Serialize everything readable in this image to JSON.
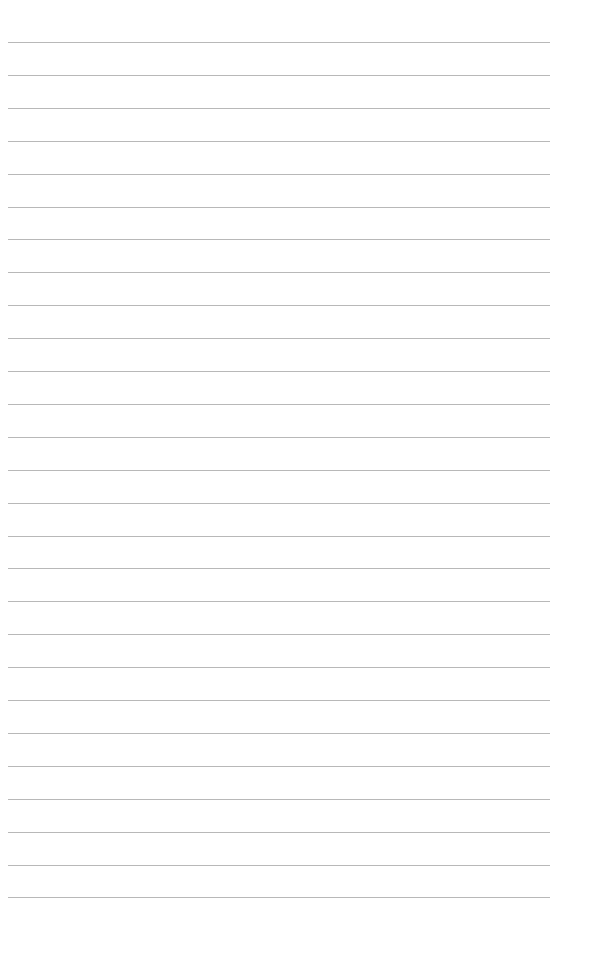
{
  "page": {
    "type": "lined-paper",
    "background_color": "#ffffff",
    "line_color": "#b8b8b8",
    "line_count": 27,
    "first_line_y": 42,
    "line_spacing": 32.9,
    "line_left": 8,
    "line_width": 542,
    "text": ""
  }
}
